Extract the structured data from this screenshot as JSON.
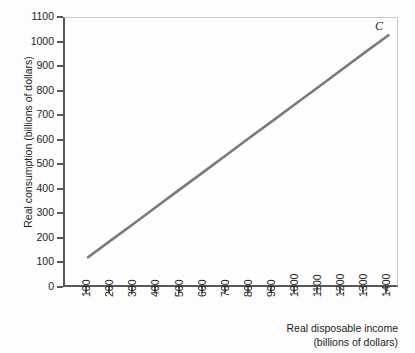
{
  "chart_data": {
    "type": "line",
    "title": "",
    "xlabel": "Real disposable income (billions of dollars)",
    "ylabel": "Real consumption (billions of dollars)",
    "xlabel_line1": "Real disposable income",
    "xlabel_line2": "(billions of dollars)",
    "xlim": [
      0,
      1450
    ],
    "ylim": [
      0,
      1100
    ],
    "grid": false,
    "legend": "none",
    "x_ticks": [
      100,
      200,
      300,
      400,
      500,
      600,
      700,
      800,
      900,
      1000,
      1100,
      1200,
      1300,
      1400
    ],
    "y_ticks": [
      0,
      100,
      200,
      300,
      400,
      500,
      600,
      700,
      800,
      900,
      1000,
      1100
    ],
    "x_tick_labels": [
      "100",
      "200",
      "300",
      "400",
      "500",
      "600",
      "700",
      "800",
      "900",
      "1000",
      "1100",
      "1200",
      "1300",
      "1400"
    ],
    "y_tick_labels": [
      "0",
      "100",
      "200",
      "300",
      "400",
      "500",
      "600",
      "700",
      "800",
      "900",
      "1000",
      "1100"
    ],
    "series": [
      {
        "name": "C",
        "annotation": "C",
        "color": "#7a7a7c",
        "x": [
          100,
          1400
        ],
        "values": [
          125,
          1030
        ],
        "points": [
          {
            "x": 100,
            "y": 125
          },
          {
            "x": 200,
            "y": 195
          },
          {
            "x": 300,
            "y": 264
          },
          {
            "x": 400,
            "y": 334
          },
          {
            "x": 500,
            "y": 404
          },
          {
            "x": 600,
            "y": 473
          },
          {
            "x": 700,
            "y": 543
          },
          {
            "x": 800,
            "y": 613
          },
          {
            "x": 900,
            "y": 682
          },
          {
            "x": 1000,
            "y": 752
          },
          {
            "x": 1100,
            "y": 821
          },
          {
            "x": 1200,
            "y": 891
          },
          {
            "x": 1300,
            "y": 961
          },
          {
            "x": 1400,
            "y": 1030
          }
        ]
      }
    ],
    "colors": {
      "line": "#7a7a7c",
      "axis": "#58585a",
      "frame_light": "#c9c9cb",
      "text": "#231f20",
      "background": "#fdfdfd"
    }
  }
}
